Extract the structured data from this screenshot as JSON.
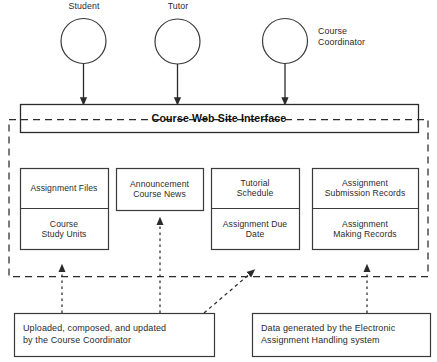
{
  "diagram": {
    "title": "Course Web Site Interface",
    "actors": [
      {
        "id": "student",
        "label": "Student",
        "cx": 83.5,
        "cy": 41,
        "r": 22.5,
        "label_x": 59,
        "label_y": 1,
        "label_w": 50,
        "label_align": "center"
      },
      {
        "id": "tutor",
        "label": "Tutor",
        "cx": 177.5,
        "cy": 41.5,
        "r": 22.5,
        "label_x": 153,
        "label_y": 1,
        "label_w": 50,
        "label_align": "center"
      },
      {
        "id": "course-coordinator",
        "label": "Course\nCoordinator",
        "cx": 285,
        "cy": 41,
        "r": 22.5,
        "label_x": 318,
        "label_y": 26,
        "label_w": 80,
        "label_align": "left"
      }
    ],
    "interface_bar": {
      "label": "Course Web Site Interface",
      "x": 20,
      "y": 104,
      "w": 398,
      "h": 28
    },
    "system_boundary": {
      "x": 9,
      "y": 119,
      "w": 419,
      "h": 157
    },
    "content_groups": [
      {
        "id": "course-materials",
        "x": 20,
        "y": 168,
        "w": 88,
        "h": 81,
        "cells": [
          {
            "id": "assignment-files",
            "label": "Assignment Files",
            "h": 40
          },
          {
            "id": "course-study-units",
            "label": "Course\nStudy Units",
            "h": 41
          }
        ]
      },
      {
        "id": "announcements",
        "x": 116,
        "y": 168,
        "w": 87,
        "h": 42,
        "cells": [
          {
            "id": "announcement-course-news",
            "label": "Announcement\nCourse News",
            "h": 42
          }
        ]
      },
      {
        "id": "schedule-group",
        "x": 211,
        "y": 168,
        "w": 88,
        "h": 81,
        "cells": [
          {
            "id": "tutorial-schedule",
            "label": "Tutorial\nSchedule",
            "h": 40
          },
          {
            "id": "assignment-due-date",
            "label": "Assignment Due\nDate",
            "h": 41
          }
        ]
      },
      {
        "id": "records-group",
        "x": 312,
        "y": 168,
        "w": 106,
        "h": 81,
        "cells": [
          {
            "id": "assignment-submission-records",
            "label": "Assignment\nSubmission Records",
            "h": 40
          },
          {
            "id": "assignment-making-records",
            "label": "Assignment\nMaking Records",
            "h": 41
          }
        ]
      }
    ],
    "notes": [
      {
        "id": "note-coordinator",
        "label": "Uploaded, composed, and updated\nby the Course Coordinator",
        "x": 14,
        "y": 313,
        "w": 200,
        "h": 43
      },
      {
        "id": "note-eah-system",
        "label": "Data generated by the Electronic\nAssignment Handling system",
        "x": 252,
        "y": 313,
        "w": 178,
        "h": 43
      }
    ],
    "solid_arrows": [
      {
        "id": "student-to-interface",
        "x1": 83.5,
        "y1": 63.5,
        "x2": 83.5,
        "y2": 104
      },
      {
        "id": "tutor-to-interface",
        "x1": 177.5,
        "y1": 64,
        "x2": 177.5,
        "y2": 104
      },
      {
        "id": "coordinator-to-interface",
        "x1": 285,
        "y1": 63.5,
        "x2": 285,
        "y2": 104
      }
    ],
    "dashed_arrows": [
      {
        "id": "coordinator-note-to-materials",
        "x1": 62,
        "y1": 313,
        "x2": 62,
        "y2": 265
      },
      {
        "id": "coordinator-note-to-announcements",
        "x1": 160,
        "y1": 313,
        "x2": 160,
        "y2": 218
      },
      {
        "id": "coordinator-note-to-schedule",
        "x1": 204,
        "y1": 313,
        "x2": 255,
        "y2": 270
      },
      {
        "id": "eah-note-to-records",
        "x1": 367,
        "y1": 313,
        "x2": 367,
        "y2": 265
      }
    ],
    "colors": {
      "stroke": "#3a3a3a",
      "boundary": "#2b2b2b",
      "background": "#ffffff",
      "text": "#2b2b2b"
    }
  }
}
